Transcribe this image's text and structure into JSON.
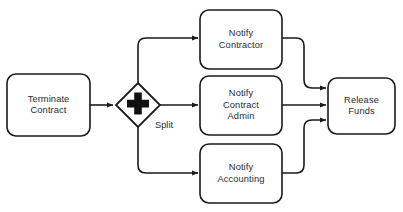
{
  "diagram": {
    "type": "bpmn-process-flow",
    "stroke_color": "#1a1a1a",
    "fill_color": "#ffffff",
    "text_color": "#2b2b2b",
    "background": "#ffffff",
    "nodes": [
      {
        "id": "terminate-contract",
        "shape": "task",
        "label": "Terminate\nContract",
        "x": 7,
        "y": 74,
        "w": 83,
        "h": 62
      },
      {
        "id": "parallel-gateway-split",
        "shape": "gateway-parallel",
        "label": "Split",
        "cx": 138,
        "cy": 105,
        "r": 22
      },
      {
        "id": "notify-contractor",
        "shape": "task",
        "label": "Notify\nContractor",
        "x": 200,
        "y": 10,
        "w": 82,
        "h": 59
      },
      {
        "id": "notify-contract-admin",
        "shape": "task",
        "label": "Notify\nContract\nAdmin",
        "x": 200,
        "y": 76,
        "w": 82,
        "h": 59
      },
      {
        "id": "notify-accounting",
        "shape": "task",
        "label": "Notify\nAccounting",
        "x": 200,
        "y": 144,
        "w": 82,
        "h": 59
      },
      {
        "id": "release-funds",
        "shape": "task",
        "label": "Release\nFunds",
        "x": 328,
        "y": 78,
        "w": 67,
        "h": 56
      }
    ],
    "edges": [
      {
        "id": "terminate-to-gateway",
        "from": "terminate-contract",
        "to": "parallel-gateway-split"
      },
      {
        "id": "gateway-to-contractor",
        "from": "parallel-gateway-split",
        "to": "notify-contractor"
      },
      {
        "id": "gateway-to-contract-admin",
        "from": "parallel-gateway-split",
        "to": "notify-contract-admin"
      },
      {
        "id": "gateway-to-accounting",
        "from": "parallel-gateway-split",
        "to": "notify-accounting"
      },
      {
        "id": "contractor-to-release",
        "from": "notify-contractor",
        "to": "release-funds"
      },
      {
        "id": "contract-admin-to-release",
        "from": "notify-contract-admin",
        "to": "release-funds"
      },
      {
        "id": "accounting-to-release",
        "from": "notify-accounting",
        "to": "release-funds"
      }
    ]
  },
  "caption": {
    "text": ""
  }
}
